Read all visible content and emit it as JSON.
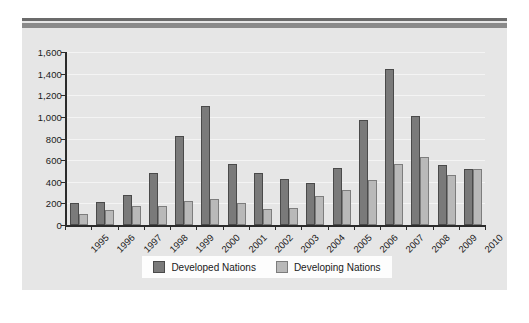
{
  "chart_data": {
    "type": "bar",
    "title": "",
    "xlabel": "",
    "ylabel": "",
    "ylim": [
      0,
      1600
    ],
    "ytick_labels": [
      "1,600",
      "1,400",
      "1,200",
      "1,000",
      "800",
      "600",
      "400",
      "200",
      "0"
    ],
    "ytick_values": [
      1600,
      1400,
      1200,
      1000,
      800,
      600,
      400,
      200,
      0
    ],
    "grid": true,
    "legend_position": "bottom",
    "categories": [
      "1995",
      "1996",
      "1997",
      "1998",
      "1999",
      "2000",
      "2001",
      "2002",
      "2003",
      "2004",
      "2005",
      "2006",
      "2007",
      "2008",
      "2009",
      "2010"
    ],
    "series": [
      {
        "name": "Developed Nations",
        "color": "#7a7a7a",
        "values": [
          200,
          215,
          275,
          480,
          825,
          1105,
          560,
          485,
          430,
          385,
          530,
          970,
          1440,
          1010,
          555,
          515
        ]
      },
      {
        "name": "Developing Nations",
        "color": "#b9b9b9",
        "values": [
          105,
          140,
          175,
          180,
          225,
          245,
          205,
          145,
          160,
          265,
          325,
          420,
          560,
          625,
          465,
          515
        ]
      }
    ]
  },
  "legend": {
    "items": [
      {
        "label": "Developed Nations",
        "swatch": "dark"
      },
      {
        "label": "Developing Nations",
        "swatch": "light"
      }
    ]
  },
  "colors": {
    "developed": "#7a7a7a",
    "developing": "#b9b9b9",
    "panel_background": "#e6e6e6",
    "axis": "#2b2b2b",
    "gridline": "#f4f4f4"
  }
}
